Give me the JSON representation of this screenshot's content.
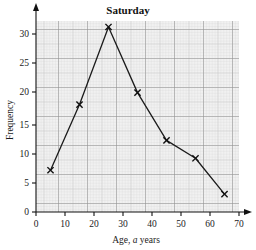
{
  "chart_data": {
    "type": "line",
    "title": "Saturday",
    "xlabel_parts": {
      "pre": "Age, ",
      "italic": "a",
      "post": " years"
    },
    "xlabel": "Age, a years",
    "ylabel": "Frequency",
    "x": [
      5,
      15,
      25,
      35,
      45,
      55,
      65
    ],
    "values": [
      7,
      18,
      31,
      20,
      12,
      9,
      3
    ],
    "series": [
      {
        "name": "Saturday frequency",
        "points": [
          {
            "x": 5,
            "y": 7
          },
          {
            "x": 15,
            "y": 18
          },
          {
            "x": 25,
            "y": 31
          },
          {
            "x": 35,
            "y": 20
          },
          {
            "x": 45,
            "y": 12
          },
          {
            "x": 55,
            "y": 9
          },
          {
            "x": 65,
            "y": 3
          }
        ]
      }
    ],
    "xlim": [
      0,
      70
    ],
    "ylim": [
      0,
      32
    ],
    "xticks": [
      0,
      10,
      20,
      30,
      40,
      50,
      60,
      70
    ],
    "yticks": [
      0,
      5,
      10,
      15,
      20,
      25,
      30
    ],
    "xtick_labels": [
      "0",
      "10",
      "20",
      "30",
      "40",
      "50",
      "60",
      "70"
    ],
    "ytick_labels": [
      "0",
      "5",
      "10",
      "15",
      "20",
      "25",
      "30"
    ],
    "grid": "graph-paper",
    "grid_minor_step_x": 2,
    "grid_minor_step_y": 1,
    "grid_major_step_x": 10,
    "grid_major_step_y": 10,
    "legend": "none",
    "marker_style": "cross",
    "colors": {
      "line": "#1b1b1b",
      "marker": "#111111",
      "axis": "#111111",
      "text": "#1a1a1a",
      "grid_minor": "#d8d8d8",
      "grid_major": "#9a9a9a",
      "plot_background": "#f2f2f2",
      "page_background": "#ffffff"
    }
  }
}
